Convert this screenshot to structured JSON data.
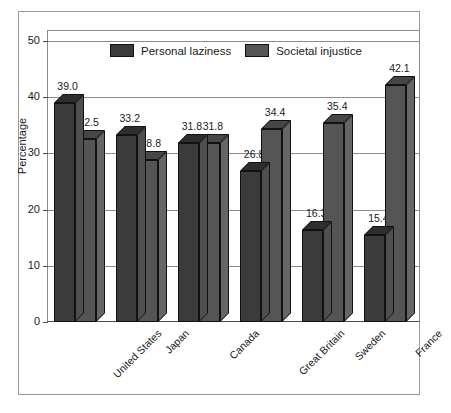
{
  "chart_data": {
    "type": "bar",
    "title": "",
    "subtitle": "",
    "xlabel": "",
    "ylabel": "Percentage",
    "ylim": [
      0,
      50
    ],
    "yticks": [
      0,
      10,
      20,
      30,
      40,
      50
    ],
    "ytick_labels": [
      "0",
      "10",
      "20",
      "30",
      "40",
      "50"
    ],
    "grid": true,
    "legend_position": "top-center",
    "style": "3d-clustered-bar",
    "categories": [
      "United States",
      "Japan",
      "Canada",
      "Great Britain",
      "Sweden",
      "France"
    ],
    "series": [
      {
        "name": "Personal laziness",
        "color": "#3b3b3b",
        "values": [
          39.0,
          33.2,
          31.8,
          26.8,
          16.3,
          15.4
        ],
        "value_labels": [
          "39.0",
          "33.2",
          "31.8",
          "26.8",
          "16.3",
          "15.4"
        ]
      },
      {
        "name": "Societal injustice",
        "color": "#555555",
        "values": [
          32.5,
          28.8,
          31.8,
          34.4,
          35.4,
          42.1
        ],
        "value_labels": [
          "32.5",
          "28.8",
          "31.8",
          "34.4",
          "35.4",
          "42.1"
        ]
      }
    ]
  },
  "colors": {
    "series1": "#3b3b3b",
    "series2": "#555555",
    "frame": "#9a9a9a",
    "axis": "#4a4a4a",
    "gridline": "#8d8d8d",
    "text": "#1a1a1a",
    "background": "#ffffff"
  }
}
